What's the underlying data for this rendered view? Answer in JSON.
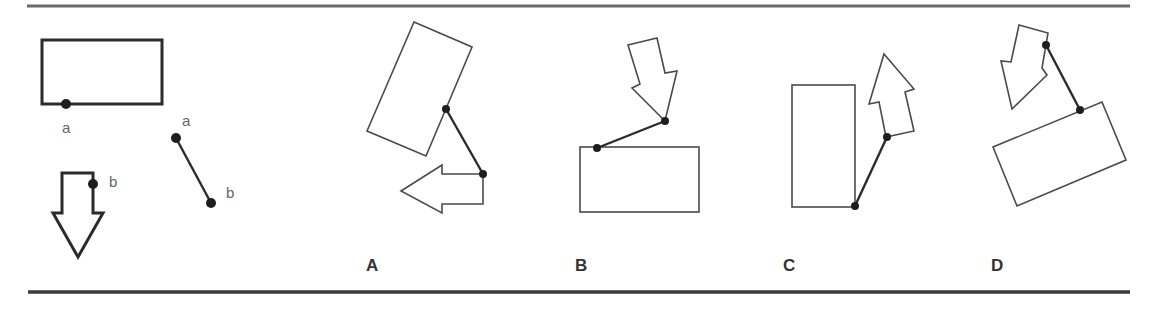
{
  "figure": {
    "type": "spatial-reasoning-puzzle",
    "reference": {
      "shapes": [
        "rectangle",
        "down-arrow",
        "connector-line"
      ],
      "point_labels": {
        "rect_point": "a",
        "arrow_point": "b",
        "line_start": "a",
        "line_end": "b"
      }
    },
    "options": [
      {
        "label": "A"
      },
      {
        "label": "B"
      },
      {
        "label": "C"
      },
      {
        "label": "D"
      }
    ]
  }
}
